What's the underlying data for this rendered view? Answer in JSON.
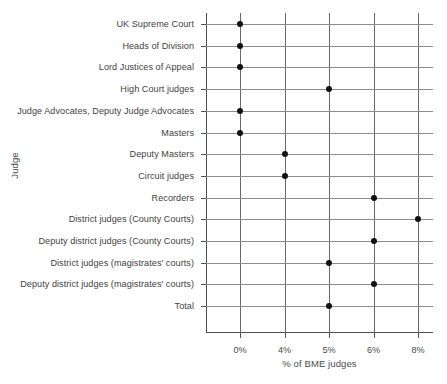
{
  "chart_data": {
    "type": "scatter",
    "title": "",
    "xlabel": "% of BME judges",
    "ylabel": "Judge",
    "grid": true,
    "legend": "none",
    "orientation": "horizontal",
    "x_tick_labels": [
      "0%",
      "4%",
      "5%",
      "6%",
      "8%"
    ],
    "x_tick_values": [
      0,
      4,
      5,
      6,
      8
    ],
    "x_axis_note": "tick positions are evenly spaced (categorical-style spacing), not linear",
    "categories": [
      "UK Supreme Court",
      "Heads of Division",
      "Lord Justices of Appeal",
      "High Court judges",
      "Judge Advocates, Deputy Judge Advocates",
      "Masters",
      "Deputy Masters",
      "Circuit judges",
      "Recorders",
      "District judges (County Courts)",
      "Deputy district judges (County Courts)",
      "District judges (magistrates' courts)",
      "Deputy district judges (magistrates' courts)",
      "Total"
    ],
    "values": [
      0,
      0,
      0,
      5,
      0,
      0,
      4,
      4,
      6,
      8,
      6,
      5,
      6,
      5
    ],
    "value_labels": [
      "0%",
      "0%",
      "0%",
      "5%",
      "0%",
      "0%",
      "4%",
      "4%",
      "6%",
      "8%",
      "6%",
      "5%",
      "6%",
      "5%"
    ],
    "marker_color": "#111111",
    "gridline_color": "#8c8c8c",
    "axis_color": "#4f4f4f",
    "background_color": "#ffffff"
  }
}
